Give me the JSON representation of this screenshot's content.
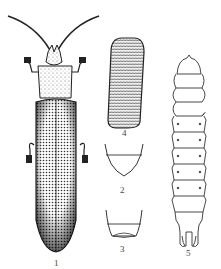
{
  "figure": {
    "ink_color": "#222222",
    "background": "#ffffff",
    "panels": [
      {
        "id": "1",
        "label": "1",
        "subject": "adult beetle, dorsal view"
      },
      {
        "id": "2",
        "label": "2",
        "subject": "abdominal tip (rounded)"
      },
      {
        "id": "3",
        "label": "3",
        "subject": "abdominal tip (truncate)"
      },
      {
        "id": "4",
        "label": "4",
        "subject": "egg"
      },
      {
        "id": "5",
        "label": "5",
        "subject": "larva"
      }
    ]
  }
}
